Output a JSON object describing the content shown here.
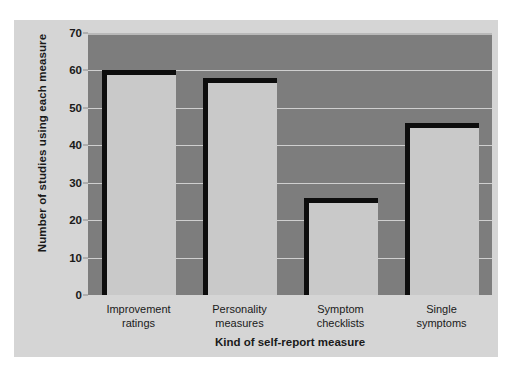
{
  "chart_data": {
    "type": "bar",
    "title": "",
    "xlabel": "Kind of self-report measure",
    "ylabel": "Number of studies using each measure",
    "categories": [
      "Improvement ratings",
      "Personality measures",
      "Symptom checklists",
      "Single symptoms"
    ],
    "category_lines": [
      [
        "Improvement",
        "ratings"
      ],
      [
        "Personality",
        "measures"
      ],
      [
        "Symptom",
        "checklists"
      ],
      [
        "Single",
        "symptoms"
      ]
    ],
    "values": [
      60,
      58,
      26,
      46
    ],
    "ylim": [
      0,
      70
    ],
    "yticks": [
      0,
      10,
      20,
      30,
      40,
      50,
      60,
      70
    ],
    "ytick_labels": [
      "0",
      "10",
      "20",
      "30",
      "40",
      "50",
      "60",
      "70"
    ],
    "grid": true,
    "legend": "none"
  },
  "style": {
    "figure_background": "#ffffff",
    "panel_background": "#d5d5d5",
    "plot_background": "#7d7d7d",
    "bar_fill": "#c9c9c9",
    "bar_edge": "#0d0d0d",
    "gridline_color": "#cfcfcf",
    "text_color": "#1a1a1a"
  }
}
